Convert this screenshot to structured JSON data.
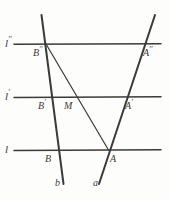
{
  "figure": {
    "canvas": {
      "width": 169,
      "height": 200
    },
    "colors": {
      "background": "#fdfdfc",
      "ink": "#3a3a38",
      "label": "#3a3a38"
    },
    "parallel_lines": [
      {
        "id": "line-l2",
        "name": "l''",
        "label": "l",
        "label_superscript": "′′",
        "y": 44,
        "x1": 14,
        "x2": 161,
        "label_x": 6,
        "label_y": 38
      },
      {
        "id": "line-l1",
        "name": "l'",
        "label": "l",
        "label_superscript": "′",
        "y": 97,
        "x1": 14,
        "x2": 161,
        "label_x": 6,
        "label_y": 91
      },
      {
        "id": "line-l0",
        "name": "l",
        "label": "l",
        "label_superscript": "",
        "y": 150,
        "x1": 14,
        "x2": 161,
        "label_x": 6,
        "label_y": 144
      }
    ],
    "transversals": [
      {
        "id": "transversal-b",
        "name": "b",
        "label": "b",
        "x1": 42,
        "y1": 15,
        "x2": 63,
        "y2": 185,
        "label_x": 56,
        "label_y": 182
      },
      {
        "id": "transversal-a",
        "name": "a",
        "label": "a",
        "x1": 155,
        "y1": 15,
        "x2": 99,
        "y2": 185,
        "label_x": 94,
        "label_y": 182
      }
    ],
    "segments": [
      {
        "id": "segment-b2-a0",
        "name": "B''A",
        "x1": 46,
        "y1": 44,
        "x2": 110,
        "y2": 150
      }
    ],
    "points": [
      {
        "id": "point-B2",
        "label": "B",
        "superscript": "′′",
        "x": 46,
        "y": 44,
        "label_x": 34,
        "label_y": 48
      },
      {
        "id": "point-A2",
        "label": "A",
        "superscript": "′′",
        "x": 142,
        "y": 44,
        "label_x": 142,
        "label_y": 48
      },
      {
        "id": "point-B1",
        "label": "B",
        "superscript": "′",
        "x": 53,
        "y": 97,
        "label_x": 37,
        "label_y": 101
      },
      {
        "id": "point-M",
        "label": "M",
        "superscript": "",
        "x": 78,
        "y": 97,
        "label_x": 65,
        "label_y": 101
      },
      {
        "id": "point-A1",
        "label": "A",
        "superscript": "′",
        "x": 124,
        "y": 97,
        "label_x": 124,
        "label_y": 101
      },
      {
        "id": "point-B0",
        "label": "B",
        "superscript": "",
        "x": 60,
        "y": 150,
        "label_x": 44,
        "label_y": 154
      },
      {
        "id": "point-A0",
        "label": "A",
        "superscript": "",
        "x": 107,
        "y": 150,
        "label_x": 110,
        "label_y": 154
      }
    ]
  }
}
